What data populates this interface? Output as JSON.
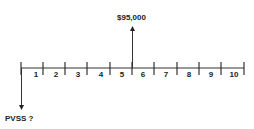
{
  "diagram": {
    "type": "cash-flow timeline",
    "periods": [
      "1",
      "2",
      "3",
      "4",
      "5",
      "6",
      "7",
      "8",
      "9",
      "10"
    ],
    "inflow": {
      "label": "$95,000",
      "at_period_boundary": 5
    },
    "outflow": {
      "label": "PVSS ?",
      "at_period_boundary": 0
    }
  }
}
